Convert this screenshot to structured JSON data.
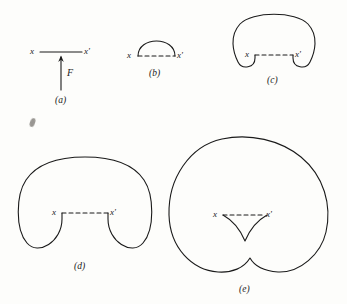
{
  "figure": {
    "background_color": "#fdfdfb",
    "ink_color": "#1a1a1a",
    "stroke_width": 1.1,
    "panels": [
      {
        "id": "a",
        "caption": "(a)",
        "caption_x": 62,
        "caption_y": 100,
        "left_label": "x",
        "right_label": "x'",
        "left_label_x": 30,
        "left_label_y": 47,
        "right_label_x": 84,
        "right_label_y": 47,
        "force_label": "F",
        "force_label_x": 67,
        "force_label_y": 73,
        "baseline_style": "solid",
        "baseline_y": 52,
        "baseline_x1": 40,
        "baseline_x2": 82,
        "arrow_x": 61,
        "arrow_y_tail": 90,
        "arrow_y_head": 56,
        "description": "straight string segment with upward force arrow"
      },
      {
        "id": "b",
        "caption": "(b)",
        "caption_x": 158,
        "caption_y": 73,
        "left_label": "x",
        "right_label": "x'",
        "left_label_x": 126,
        "left_label_y": 54,
        "right_label_x": 180,
        "right_label_y": 54,
        "baseline_style": "dashed",
        "baseline_y": 56,
        "baseline_x1": 136,
        "baseline_x2": 177,
        "description": "small semicircular bulge above dashed chord"
      },
      {
        "id": "c",
        "caption": "(c)",
        "caption_x": 272,
        "caption_y": 80,
        "left_label": "x",
        "right_label": "x'",
        "left_label_x": 243,
        "left_label_y": 52,
        "right_label_x": 297,
        "right_label_y": 52,
        "baseline_style": "dashed",
        "baseline_y": 55,
        "baseline_x1": 253,
        "baseline_x2": 294,
        "description": "large dome with two small lobes dipping below chord"
      },
      {
        "id": "d",
        "caption": "(d)",
        "caption_x": 79,
        "caption_y": 267,
        "left_label": "x",
        "right_label": "x'",
        "left_label_x": 50,
        "left_label_y": 210,
        "right_label_x": 104,
        "right_label_y": 210,
        "baseline_style": "dashed",
        "baseline_y": 213,
        "baseline_x1": 60,
        "baseline_x2": 101,
        "description": "larger dome with two deep round lobes below chord"
      },
      {
        "id": "e",
        "caption": "(e)",
        "caption_x": 240,
        "caption_y": 290,
        "left_label": "x",
        "right_label": "x'",
        "left_label_x": 211,
        "left_label_y": 212,
        "right_label_x": 265,
        "right_label_y": 212,
        "baseline_style": "dashed",
        "baseline_y": 215,
        "baseline_x1": 221,
        "baseline_x2": 262,
        "description": "very large near-circular loop with bottom cusp and small inner V cusp"
      }
    ],
    "artifact": {
      "name": "scan-smudge",
      "x": 30,
      "y": 118
    }
  }
}
